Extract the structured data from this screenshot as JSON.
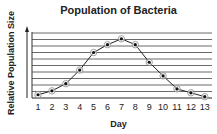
{
  "chart_data": {
    "type": "line",
    "title": "Population of Bacteria",
    "xlabel": "Day",
    "ylabel": "Relative Population Size",
    "categories": [
      "1",
      "2",
      "3",
      "4",
      "5",
      "6",
      "7",
      "8",
      "9",
      "10",
      "11",
      "12",
      "13"
    ],
    "x": [
      1,
      2,
      3,
      4,
      5,
      6,
      7,
      8,
      9,
      10,
      11,
      12,
      13
    ],
    "values": [
      0.5,
      1.1,
      2.2,
      4.3,
      7.0,
      8.2,
      9.1,
      8.2,
      5.5,
      3.4,
      1.4,
      0.8,
      0.2
    ],
    "ylim": [
      0,
      10
    ],
    "grid": "horizontal",
    "y_ticks_labeled": false,
    "legend": null
  }
}
